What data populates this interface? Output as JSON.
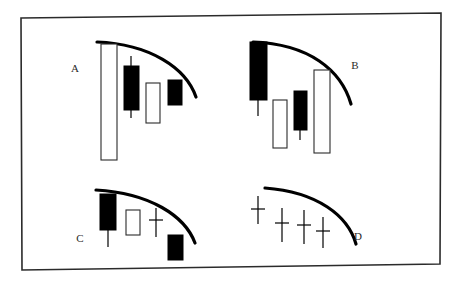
{
  "figure": {
    "title": "",
    "background": "#ffffff",
    "border_color": "#2b2b2b",
    "ink_color": "#000000",
    "outline_color": "#2b2b2b",
    "frame": {
      "corners_px": [
        [
          21,
          18
        ],
        [
          441,
          13
        ],
        [
          440,
          264
        ],
        [
          22,
          270
        ]
      ],
      "stroke_width": 1.6
    }
  },
  "chart_data": {
    "type": "candlestick-diagram",
    "title": "",
    "xlabel": "",
    "ylabel": "",
    "grid": false,
    "legend": "none",
    "panel_labels": [
      "A",
      "B",
      "C",
      "D"
    ],
    "panels": [
      {
        "label": "A",
        "label_pos": [
          75,
          72
        ],
        "arc": {
          "start": [
            97,
            42
          ],
          "ctrl1": [
            150,
            44
          ],
          "ctrl2": [
            186,
            68
          ],
          "end": [
            196,
            97
          ]
        },
        "candles": [
          {
            "name": "candle-1",
            "body": "hollow",
            "x": 101,
            "body_top": 44,
            "body_bottom": 160,
            "width": 16,
            "wick_x": 109,
            "wick_top": 44,
            "wick_bottom": 160
          },
          {
            "name": "candle-2",
            "body": "filled",
            "x": 124,
            "body_top": 66,
            "body_bottom": 110,
            "width": 15,
            "wick_x": 131,
            "wick_top": 56,
            "wick_bottom": 118
          },
          {
            "name": "candle-3",
            "body": "hollow",
            "x": 146,
            "body_top": 83,
            "body_bottom": 123,
            "width": 14,
            "wick_x": 153,
            "wick_top": 83,
            "wick_bottom": 123
          },
          {
            "name": "candle-4",
            "body": "filled",
            "x": 168,
            "body_top": 80,
            "body_bottom": 105,
            "width": 14,
            "wick_x": 175,
            "wick_top": 80,
            "wick_bottom": 105
          }
        ]
      },
      {
        "label": "B",
        "label_pos": [
          355,
          69
        ],
        "arc": {
          "start": [
            253,
            42
          ],
          "ctrl1": [
            309,
            44
          ],
          "ctrl2": [
            341,
            70
          ],
          "end": [
            351,
            104
          ]
        },
        "candles": [
          {
            "name": "candle-1",
            "body": "filled",
            "x": 250,
            "body_top": 42,
            "body_bottom": 100,
            "width": 17,
            "wick_x": 258,
            "wick_top": 42,
            "wick_bottom": 116
          },
          {
            "name": "candle-2",
            "body": "hollow",
            "x": 273,
            "body_top": 100,
            "body_bottom": 148,
            "width": 14,
            "wick_x": 280,
            "wick_top": 100,
            "wick_bottom": 148
          },
          {
            "name": "candle-3",
            "body": "filled",
            "x": 294,
            "body_top": 91,
            "body_bottom": 130,
            "width": 13,
            "wick_x": 300,
            "wick_top": 91,
            "wick_bottom": 140
          },
          {
            "name": "candle-4",
            "body": "hollow",
            "x": 314,
            "body_top": 70,
            "body_bottom": 153,
            "width": 16,
            "wick_x": 322,
            "wick_top": 70,
            "wick_bottom": 153
          }
        ]
      },
      {
        "label": "C",
        "label_pos": [
          80,
          242
        ],
        "arc": {
          "start": [
            96,
            190
          ],
          "ctrl1": [
            150,
            193
          ],
          "ctrl2": [
            185,
            216
          ],
          "end": [
            195,
            243
          ]
        },
        "candles": [
          {
            "name": "candle-1",
            "body": "filled",
            "x": 100,
            "body_top": 194,
            "body_bottom": 230,
            "width": 16,
            "wick_x": 108,
            "wick_top": 194,
            "wick_bottom": 247
          },
          {
            "name": "candle-2",
            "body": "hollow",
            "x": 126,
            "body_top": 210,
            "body_bottom": 235,
            "width": 14,
            "wick_x": 133,
            "wick_top": 210,
            "wick_bottom": 235
          },
          {
            "name": "candle-3",
            "body": "doji",
            "x": 149,
            "body_top": 219,
            "body_bottom": 221,
            "width": 14,
            "wick_x": 156,
            "wick_top": 208,
            "wick_bottom": 237
          },
          {
            "name": "candle-4",
            "body": "filled",
            "x": 168,
            "body_top": 235,
            "body_bottom": 260,
            "width": 15,
            "wick_x": 175,
            "wick_top": 235,
            "wick_bottom": 260
          }
        ]
      },
      {
        "label": "D",
        "label_pos": [
          358,
          240
        ],
        "arc": {
          "start": [
            265,
            188
          ],
          "ctrl1": [
            318,
            192
          ],
          "ctrl2": [
            348,
            216
          ],
          "end": [
            356,
            244
          ]
        },
        "candles": [
          {
            "name": "candle-1",
            "body": "doji",
            "x": 251,
            "body_top": 208,
            "body_bottom": 210,
            "width": 14,
            "wick_x": 258,
            "wick_top": 196,
            "wick_bottom": 224
          },
          {
            "name": "candle-2",
            "body": "doji",
            "x": 275,
            "body_top": 222,
            "body_bottom": 224,
            "width": 14,
            "wick_x": 282,
            "wick_top": 208,
            "wick_bottom": 242
          },
          {
            "name": "candle-3",
            "body": "doji",
            "x": 297,
            "body_top": 224,
            "body_bottom": 226,
            "width": 14,
            "wick_x": 304,
            "wick_top": 210,
            "wick_bottom": 244
          },
          {
            "name": "candle-4",
            "body": "doji",
            "x": 316,
            "body_top": 230,
            "body_bottom": 232,
            "width": 14,
            "wick_x": 323,
            "wick_top": 217,
            "wick_bottom": 248
          }
        ]
      }
    ]
  }
}
